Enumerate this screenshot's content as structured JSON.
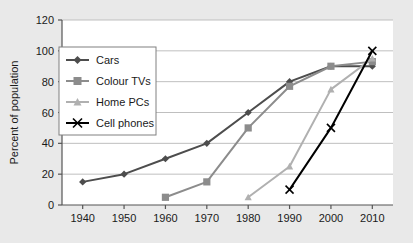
{
  "chart_data": {
    "type": "line",
    "title": "",
    "subtitle": "",
    "xlabel": "",
    "ylabel": "Percent of population",
    "categories": [
      1940,
      1950,
      1960,
      1970,
      1980,
      1990,
      2000,
      2010
    ],
    "xtick_labels": [
      "1940",
      "1950",
      "1960",
      "1970",
      "1980",
      "1990",
      "2000",
      "2010"
    ],
    "ytick_labels": [
      "0",
      "20",
      "40",
      "60",
      "80",
      "100",
      "120"
    ],
    "yticks": [
      0,
      20,
      40,
      60,
      80,
      100,
      120
    ],
    "ylim": [
      0,
      120
    ],
    "xlim": [
      1935,
      2015
    ],
    "grid": "horizontal",
    "legend_position": "upper-left-inside",
    "plot_background": "#ffffff",
    "figure_background": "#e9e9e9",
    "grid_color": "#bfbfbf",
    "axis_color": "#555555",
    "series": [
      {
        "name": "Cars",
        "marker": "diamond",
        "color": "#4d4d4d",
        "x": [
          1940,
          1950,
          1960,
          1970,
          1980,
          1990,
          2000,
          2010
        ],
        "values": [
          15,
          20,
          30,
          40,
          60,
          80,
          90,
          90
        ]
      },
      {
        "name": "Colour TVs",
        "marker": "square",
        "color": "#8c8c8c",
        "x": [
          1960,
          1970,
          1980,
          1990,
          2000,
          2010
        ],
        "values": [
          5,
          15,
          50,
          77,
          90,
          93
        ]
      },
      {
        "name": "Home PCs",
        "marker": "triangle",
        "color": "#b0b0b0",
        "x": [
          1980,
          1990,
          2000,
          2010
        ],
        "values": [
          5,
          25,
          75,
          95
        ]
      },
      {
        "name": "Cell phones",
        "marker": "x",
        "color": "#000000",
        "x": [
          1990,
          2000,
          2010
        ],
        "values": [
          10,
          50,
          100
        ]
      }
    ]
  },
  "legend": {
    "items": [
      {
        "label": "Cars"
      },
      {
        "label": "Colour TVs"
      },
      {
        "label": "Home PCs"
      },
      {
        "label": "Cell phones"
      }
    ]
  }
}
